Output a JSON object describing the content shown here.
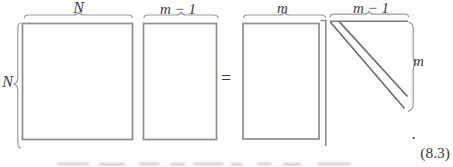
{
  "figure": {
    "lhs": {
      "matrix_a": {
        "top_label": "N",
        "left_label": "N"
      },
      "matrix_v_prev": {
        "top_label": "m − 1"
      }
    },
    "equals_sign": "=",
    "rhs": {
      "matrix_v": {
        "top_label": "m"
      },
      "hessenberg_matrix": {
        "top_label": "m − 1",
        "right_label": "m"
      }
    },
    "sentence_period": ".",
    "equation_number": "(8.3)"
  }
}
